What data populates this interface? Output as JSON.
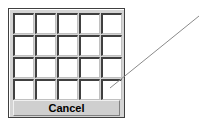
{
  "picker": {
    "rows": 4,
    "columns": 5,
    "cancel_label": "Cancel"
  },
  "annotation": {
    "line_color": "#8a8a8a"
  }
}
